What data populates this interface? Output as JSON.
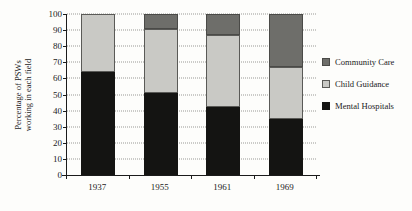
{
  "chart_data": {
    "type": "bar",
    "subtype": "stacked-bar",
    "title": "",
    "xlabel": "",
    "ylabel": "Percentage of PSWs working in each field",
    "ylabel_lines": [
      "Percentage of PSWs",
      "working in each field"
    ],
    "categories": [
      "1937",
      "1955",
      "1961",
      "1969"
    ],
    "ylim": [
      0,
      100
    ],
    "yticks": [
      0,
      10,
      20,
      30,
      40,
      50,
      60,
      70,
      80,
      90,
      100
    ],
    "ytick_labels": [
      "0",
      "10",
      "20",
      "30",
      "40",
      "50",
      "60",
      "70",
      "80",
      "90",
      "100"
    ],
    "grid": true,
    "grid_style": "dotted-horizontal",
    "legend_position": "right",
    "stack_order_bottom_to_top": [
      "Mental Hospitals",
      "Child Guidance",
      "Community Care"
    ],
    "series": [
      {
        "name": "Community Care",
        "color": "#6e6e6a",
        "values": [
          0,
          9,
          13,
          33
        ]
      },
      {
        "name": "Child Guidance",
        "color": "#c9c9c5",
        "values": [
          36,
          40,
          45,
          32
        ]
      },
      {
        "name": "Mental Hospitals",
        "color": "#141412",
        "values": [
          64,
          51,
          42,
          35
        ]
      }
    ]
  },
  "legend": {
    "items": [
      {
        "label": "Community Care",
        "swatch_class": "community"
      },
      {
        "label": "Child Guidance",
        "swatch_class": "guidance"
      },
      {
        "label": "Mental Hospitals",
        "swatch_class": "mental"
      }
    ]
  }
}
